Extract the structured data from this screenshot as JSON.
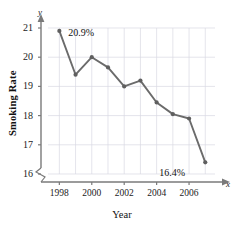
{
  "chart_data": {
    "type": "line",
    "title": "",
    "xlabel": "Year",
    "ylabel": "Smoking Rate",
    "x": [
      1998,
      1999,
      2000,
      2001,
      2002,
      2003,
      2004,
      2005,
      2006,
      2007
    ],
    "values": [
      20.9,
      19.4,
      20.0,
      19.65,
      19.0,
      19.2,
      18.45,
      18.05,
      17.9,
      16.4
    ],
    "series": [
      {
        "name": "Smoking Rate",
        "values": [
          20.9,
          19.4,
          20.0,
          19.65,
          19.0,
          19.2,
          18.45,
          18.05,
          17.9,
          16.4
        ]
      }
    ],
    "xlim": [
      1997.3,
      2007.6
    ],
    "ylim": [
      15.75,
      21.0
    ],
    "xticks": [
      1998,
      2000,
      2002,
      2004,
      2006
    ],
    "xtick_labels": [
      "1998",
      "2000",
      "2002",
      "2004",
      "2006"
    ],
    "yticks": [
      16,
      17,
      18,
      19,
      20,
      21
    ],
    "ytick_labels": [
      "16",
      "17",
      "18",
      "19",
      "20",
      "21"
    ],
    "grid": true,
    "legend": "none",
    "axis_break": true,
    "axis_letters": {
      "x": "x",
      "y": "y"
    },
    "annotations": [
      {
        "text": "20.9%",
        "x": 1998,
        "y": 20.9
      },
      {
        "text": "16.4%",
        "x": 2007,
        "y": 16.4
      }
    ],
    "colors": {
      "line": "#6b6b6b",
      "marker": "#5f5f5f",
      "grid": "#d9d9e2",
      "axis": "#7a7a7a",
      "text": "#1b1b1b"
    }
  }
}
